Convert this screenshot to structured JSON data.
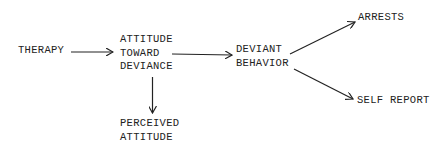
{
  "diagram": {
    "nodes": {
      "therapy": "THERAPY",
      "attitude_l1": "ATTITUDE",
      "attitude_l2": "TOWARD",
      "attitude_l3": "DEVIANCE",
      "deviant_l1": "DEVIANT",
      "deviant_l2": "BEHAVIOR",
      "arrests": "ARRESTS",
      "self_report": "SELF REPORT",
      "perceived_l1": "PERCEIVED",
      "perceived_l2": "ATTITUDE"
    },
    "edges": [
      {
        "from": "THERAPY",
        "to": "ATTITUDE TOWARD DEVIANCE"
      },
      {
        "from": "ATTITUDE TOWARD DEVIANCE",
        "to": "DEVIANT BEHAVIOR"
      },
      {
        "from": "ATTITUDE TOWARD DEVIANCE",
        "to": "PERCEIVED ATTITUDE"
      },
      {
        "from": "DEVIANT BEHAVIOR",
        "to": "ARRESTS"
      },
      {
        "from": "DEVIANT BEHAVIOR",
        "to": "SELF REPORT"
      }
    ],
    "line_color": "#222222"
  }
}
